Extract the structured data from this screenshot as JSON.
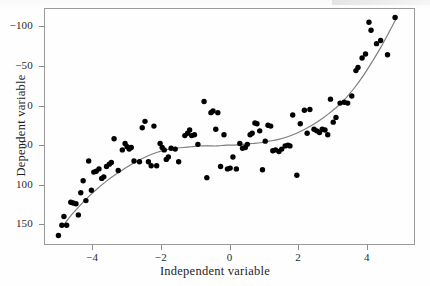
{
  "figure": {
    "background_color": "#fefefe",
    "frame_color": "#9a9a9a",
    "point_color": "#000000",
    "curve_color": "#7d7d7d"
  },
  "axis": {
    "x_label": "Independent variable",
    "y_label": "Dependent variable",
    "x_ticks": [
      "−4",
      "−2",
      "0",
      "2",
      "4"
    ],
    "y_ticks": [
      "150",
      "100",
      "50",
      "0",
      "−50",
      "−100"
    ]
  },
  "chart_data": {
    "type": "scatter",
    "title": "",
    "subtitle": "",
    "xlabel": "Independent variable",
    "ylabel": "Dependent variable",
    "xlim": [
      -5.4,
      5.4
    ],
    "ylim": [
      -126,
      173
    ],
    "xticks": [
      -4,
      -2,
      0,
      2,
      4
    ],
    "yticks": [
      -100,
      -50,
      0,
      50,
      100,
      150
    ],
    "grid": false,
    "legend": null,
    "legend_position": "none",
    "annotations": [],
    "marker": {
      "shape": "circle",
      "size_px": 5.4,
      "color": "#000000"
    },
    "series": [
      {
        "name": "observations",
        "type": "scatter",
        "n": 110,
        "points": [
          [
            -4.98,
            -114
          ],
          [
            -4.88,
            -101
          ],
          [
            -4.82,
            -90
          ],
          [
            -4.74,
            -101
          ],
          [
            -4.62,
            -72
          ],
          [
            -4.55,
            -73
          ],
          [
            -4.47,
            -74
          ],
          [
            -4.4,
            -88
          ],
          [
            -4.33,
            -60
          ],
          [
            -4.26,
            -45
          ],
          [
            -4.18,
            -70
          ],
          [
            -4.1,
            -20
          ],
          [
            -4.02,
            -57
          ],
          [
            -3.95,
            -34
          ],
          [
            -3.88,
            -33
          ],
          [
            -3.8,
            -30
          ],
          [
            -3.72,
            -42
          ],
          [
            -3.66,
            -40
          ],
          [
            -3.58,
            -27
          ],
          [
            -3.5,
            -24
          ],
          [
            -3.44,
            -22
          ],
          [
            -3.36,
            8
          ],
          [
            -3.24,
            -32
          ],
          [
            -3.12,
            -6
          ],
          [
            -3.04,
            2
          ],
          [
            -2.98,
            -2
          ],
          [
            -2.92,
            -5
          ],
          [
            -2.86,
            -3
          ],
          [
            -2.78,
            -20
          ],
          [
            -2.62,
            -21
          ],
          [
            -2.54,
            22
          ],
          [
            -2.46,
            30
          ],
          [
            -2.36,
            -21
          ],
          [
            -2.28,
            -26
          ],
          [
            -2.2,
            24
          ],
          [
            -2.12,
            -26
          ],
          [
            -2.02,
            2
          ],
          [
            -1.96,
            -3
          ],
          [
            -1.9,
            -6
          ],
          [
            -1.84,
            -18
          ],
          [
            -1.78,
            -15
          ],
          [
            -1.7,
            -4
          ],
          [
            -1.58,
            -5
          ],
          [
            -1.48,
            -21
          ],
          [
            -1.3,
            12
          ],
          [
            -1.22,
            15
          ],
          [
            -1.16,
            19
          ],
          [
            -1.1,
            12
          ],
          [
            -1.02,
            13
          ],
          [
            -0.92,
            1
          ],
          [
            -0.74,
            55
          ],
          [
            -0.66,
            -41
          ],
          [
            -0.54,
            41
          ],
          [
            -0.48,
            43
          ],
          [
            -0.4,
            20
          ],
          [
            -0.34,
            41
          ],
          [
            -0.26,
            -27
          ],
          [
            -0.16,
            13
          ],
          [
            -0.06,
            -30
          ],
          [
            0.02,
            -29
          ],
          [
            0.1,
            -15
          ],
          [
            0.2,
            -30
          ],
          [
            0.3,
            2
          ],
          [
            0.38,
            -4
          ],
          [
            0.46,
            -3
          ],
          [
            0.52,
            1
          ],
          [
            0.6,
            13
          ],
          [
            0.66,
            15
          ],
          [
            0.74,
            28
          ],
          [
            0.8,
            27
          ],
          [
            0.88,
            18
          ],
          [
            0.96,
            -31
          ],
          [
            1.04,
            5
          ],
          [
            1.12,
            25
          ],
          [
            1.2,
            24
          ],
          [
            1.26,
            -7
          ],
          [
            1.34,
            -6
          ],
          [
            1.44,
            -8
          ],
          [
            1.52,
            -5
          ],
          [
            1.62,
            -1
          ],
          [
            1.7,
            0
          ],
          [
            1.76,
            -1
          ],
          [
            1.84,
            38
          ],
          [
            1.96,
            -38
          ],
          [
            2.06,
            27
          ],
          [
            2.18,
            44
          ],
          [
            2.26,
            15
          ],
          [
            2.34,
            45
          ],
          [
            2.46,
            20
          ],
          [
            2.54,
            18
          ],
          [
            2.62,
            16
          ],
          [
            2.7,
            20
          ],
          [
            2.78,
            19
          ],
          [
            2.86,
            13
          ],
          [
            2.94,
            58
          ],
          [
            3.02,
            29
          ],
          [
            3.1,
            35
          ],
          [
            3.22,
            53
          ],
          [
            3.34,
            54
          ],
          [
            3.44,
            53
          ],
          [
            3.56,
            62
          ],
          [
            3.68,
            94
          ],
          [
            3.74,
            98
          ],
          [
            3.86,
            110
          ],
          [
            3.96,
            115
          ],
          [
            4.06,
            155
          ],
          [
            4.12,
            145
          ],
          [
            4.28,
            128
          ],
          [
            4.4,
            132
          ],
          [
            4.6,
            114
          ],
          [
            4.82,
            161
          ]
        ]
      },
      {
        "name": "fitted cubic",
        "type": "line",
        "color": "#7d7d7d",
        "description": "smooth monotone cubic trend through the cloud",
        "points": [
          [
            -4.85,
            -102
          ],
          [
            -4.6,
            -88
          ],
          [
            -4.35,
            -76
          ],
          [
            -4.1,
            -65
          ],
          [
            -3.85,
            -55
          ],
          [
            -3.6,
            -46
          ],
          [
            -3.35,
            -38
          ],
          [
            -3.1,
            -31
          ],
          [
            -2.85,
            -24
          ],
          [
            -2.6,
            -18
          ],
          [
            -2.35,
            -13
          ],
          [
            -2.1,
            -9
          ],
          [
            -1.85,
            -6
          ],
          [
            -1.6,
            -4
          ],
          [
            -1.35,
            -3
          ],
          [
            -1.1,
            -2
          ],
          [
            -0.85,
            -1
          ],
          [
            -0.6,
            -1
          ],
          [
            -0.35,
            -1
          ],
          [
            -0.1,
            0
          ],
          [
            0.15,
            0
          ],
          [
            0.4,
            1
          ],
          [
            0.65,
            2
          ],
          [
            0.9,
            3
          ],
          [
            1.15,
            5
          ],
          [
            1.4,
            7
          ],
          [
            1.65,
            10
          ],
          [
            1.9,
            14
          ],
          [
            2.15,
            19
          ],
          [
            2.4,
            25
          ],
          [
            2.65,
            32
          ],
          [
            2.9,
            40
          ],
          [
            3.15,
            49
          ],
          [
            3.4,
            60
          ],
          [
            3.65,
            73
          ],
          [
            3.9,
            88
          ],
          [
            4.15,
            105
          ],
          [
            4.4,
            123
          ],
          [
            4.65,
            143
          ],
          [
            4.88,
            162
          ]
        ]
      }
    ]
  }
}
